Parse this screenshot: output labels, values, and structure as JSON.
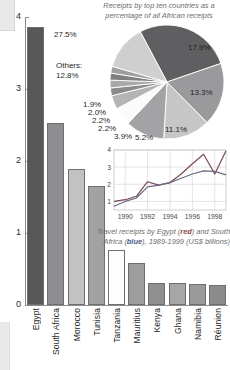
{
  "figure": {
    "type": "composite-infographic",
    "units": "US$ billions"
  },
  "bar_chart": {
    "type": "bar",
    "title": "",
    "xlabel": "",
    "ylabel": "",
    "ylim": [
      0,
      4
    ],
    "yticks": [
      "0",
      "1",
      "2",
      "3",
      "4"
    ],
    "categories": [
      "Egypt",
      "South Africa",
      "Morocco",
      "Tunisia",
      "Tanzania",
      "Mauritius",
      "Kenya",
      "Ghana",
      "Namibia",
      "Réunion"
    ],
    "values": [
      3.86,
      2.53,
      1.89,
      1.65,
      0.76,
      0.58,
      0.31,
      0.31,
      0.29,
      0.28
    ],
    "colors": [
      "#58585a",
      "#8e8e90",
      "#c2c2c3",
      "#a2a2a4",
      "#fdfdfd",
      "#9d9d9f",
      "#8f8f91",
      "#a6a6a8",
      "#9a9a9c",
      "#8b8b8d"
    ]
  },
  "pie_chart": {
    "type": "pie",
    "title": "Receipts by top ten countries as a percentage of all African receipts",
    "labels": [
      "27.5%",
      "17.9%",
      "13.3%",
      "11.1%",
      "5.2%",
      "3.9%",
      "2.2%",
      "2.2%",
      "2.0%",
      "1.9%",
      "12.8%"
    ],
    "values": [
      27.5,
      17.9,
      13.3,
      11.1,
      5.2,
      3.9,
      2.2,
      2.2,
      2.0,
      1.9,
      12.8
    ],
    "others_label": "Others:",
    "others_value": "12.8%",
    "colors": [
      "#5f5f61",
      "#9a9a9c",
      "#c6c6c7",
      "#a3a3a5",
      "#fbfbfb",
      "#b4b4b6",
      "#8a8a8c",
      "#a9a9ab",
      "#7f7f81",
      "#9e9ea0",
      "#cfcfd0"
    ]
  },
  "line_chart": {
    "type": "line",
    "caption_line1_a": "Travel receipts by Egypt (",
    "caption_red": "red",
    "caption_line1_b": ") and",
    "caption_line2_a": "South Africa (",
    "caption_blue": "blue",
    "caption_line2_b": "), 1989-1999",
    "caption_line3": "(US$ billions)",
    "xlabel": "",
    "ylabel": "",
    "xlim": [
      1989,
      1999
    ],
    "ylim": [
      0.5,
      4
    ],
    "xticks": [
      "1990",
      "1992",
      "1994",
      "1996",
      "1998"
    ],
    "yticks": [
      "1",
      "2",
      "3",
      "4"
    ],
    "x": [
      1989,
      1990,
      1991,
      1992,
      1993,
      1994,
      1995,
      1996,
      1997,
      1998,
      1999
    ],
    "series": [
      {
        "name": "Egypt",
        "color": "#7a4a4f",
        "values": [
          1.0,
          1.1,
          1.3,
          2.15,
          1.95,
          2.1,
          2.6,
          3.2,
          3.75,
          2.6,
          3.95
        ]
      },
      {
        "name": "South Africa",
        "color": "#6a6a86",
        "values": [
          0.72,
          1.0,
          1.2,
          1.85,
          1.95,
          2.1,
          2.35,
          2.6,
          2.78,
          2.75,
          2.55
        ]
      }
    ]
  }
}
